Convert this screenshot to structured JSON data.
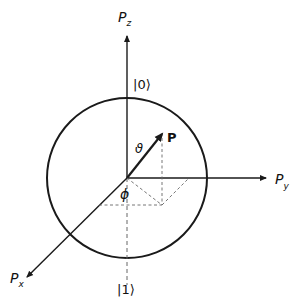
{
  "diagram": {
    "labels": {
      "axis_z": "P",
      "axis_z_sub": "z",
      "axis_y": "P",
      "axis_y_sub": "y",
      "axis_x": "P",
      "axis_x_sub": "x",
      "ket_zero": "|0⟩",
      "ket_one": "|1⟩",
      "vector": "P",
      "theta": "ϑ",
      "phi": "ϕ"
    },
    "colors": {
      "line": "#1a1a1a",
      "dashed": "#666666",
      "background": "#ffffff"
    }
  }
}
